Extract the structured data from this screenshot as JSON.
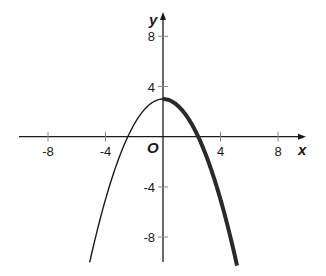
{
  "chart_data": {
    "type": "line",
    "title": "",
    "xlabel": "x",
    "ylabel": "y",
    "origin_label": "O",
    "xlim": [
      -10,
      10
    ],
    "ylim": [
      -10,
      9.5
    ],
    "grid": false,
    "x_ticks": [
      -8,
      -4,
      4,
      8
    ],
    "y_ticks": [
      8,
      4,
      -4,
      -8
    ],
    "x_tick_labels": [
      "-8",
      "-4",
      "4",
      "8"
    ],
    "y_tick_labels": [
      "8",
      "4",
      "-4",
      "-8"
    ],
    "series": [
      {
        "name": "parabola",
        "equation": "y = 3 - 0.5x^2",
        "vertex": [
          0,
          3
        ],
        "roots": [
          -2.449,
          2.449
        ],
        "domain": [
          -5.1,
          5.15
        ],
        "points": [
          [
            -5,
            -9.5
          ],
          [
            -4,
            -5
          ],
          [
            -3,
            -1.5
          ],
          [
            -2.449,
            0
          ],
          [
            -2,
            1
          ],
          [
            -1,
            2.5
          ],
          [
            0,
            3
          ],
          [
            1,
            2.5
          ],
          [
            2,
            1
          ],
          [
            2.449,
            0
          ],
          [
            3,
            -1.5
          ],
          [
            4,
            -5
          ],
          [
            5,
            -9.5
          ]
        ]
      }
    ],
    "highlighted_segment": {
      "description": "right half of parabola (x >= 0) drawn thick",
      "domain": [
        0,
        5.15
      ]
    }
  },
  "colors": {
    "axis": "#1a1a1a",
    "curve": "#1a1a1a",
    "tick": "#888888"
  }
}
